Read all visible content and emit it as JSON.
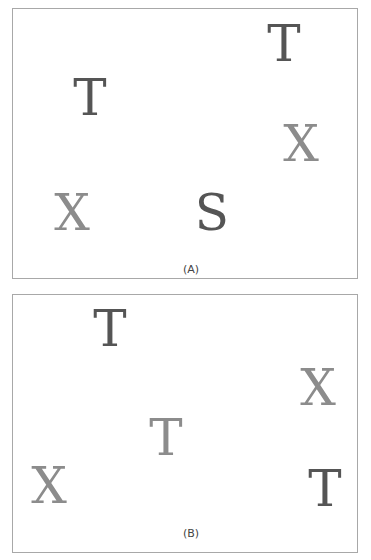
{
  "colors": {
    "dark_letter": "#555555",
    "light_letter": "#8c8c8c",
    "panel_border": "#a8a8a8",
    "background": "#ffffff"
  },
  "panels": [
    {
      "id": "A",
      "caption": "(A)",
      "box": {
        "left": 12,
        "top": 8,
        "width": 346,
        "height": 271
      },
      "caption_pos": {
        "x": 178,
        "y": 260
      },
      "items": [
        {
          "char": "T",
          "shade": "dark",
          "x": 271,
          "y": 35
        },
        {
          "char": "T",
          "shade": "dark",
          "x": 77,
          "y": 89
        },
        {
          "char": "X",
          "shade": "light",
          "x": 288,
          "y": 135
        },
        {
          "char": "X",
          "shade": "light",
          "x": 59,
          "y": 204
        },
        {
          "char": "S",
          "shade": "dark",
          "x": 199,
          "y": 204
        }
      ]
    },
    {
      "id": "B",
      "caption": "(B)",
      "box": {
        "left": 12,
        "top": 294,
        "width": 346,
        "height": 259
      },
      "caption_pos": {
        "x": 178,
        "y": 238
      },
      "items": [
        {
          "char": "T",
          "shade": "dark",
          "x": 97,
          "y": 34
        },
        {
          "char": "X",
          "shade": "light",
          "x": 305,
          "y": 93
        },
        {
          "char": "T",
          "shade": "light",
          "x": 153,
          "y": 143
        },
        {
          "char": "X",
          "shade": "light",
          "x": 36,
          "y": 191
        },
        {
          "char": "T",
          "shade": "dark",
          "x": 312,
          "y": 194
        }
      ]
    }
  ]
}
